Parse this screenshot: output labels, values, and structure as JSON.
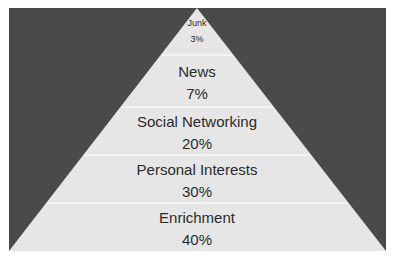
{
  "chart_data": {
    "type": "pyramid",
    "title": "",
    "order": "top-to-bottom",
    "categories": [
      "Junk",
      "News",
      "Social Networking",
      "Personal Interests",
      "Enrichment"
    ],
    "values": [
      3,
      7,
      20,
      30,
      40
    ],
    "value_labels": [
      "3%",
      "7%",
      "20%",
      "30%",
      "40%"
    ],
    "unit": "%",
    "legend": "none",
    "grid": false
  },
  "colors": {
    "background": "#4a4a4a",
    "pyramid_fill": "#e6e6e6",
    "divider": "#f7f7f7",
    "text": "#2b2b2b"
  }
}
